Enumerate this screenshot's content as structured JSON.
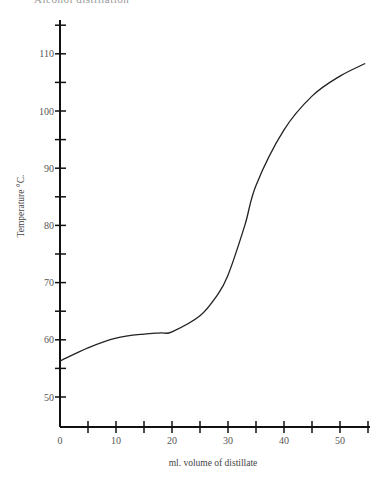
{
  "header": {
    "clipped_title": "Alcohol distillation"
  },
  "chart_data": {
    "type": "line",
    "title": "",
    "xlabel": "ml. volume of distillate",
    "ylabel": "Temperature °C.",
    "xlim": [
      0,
      55
    ],
    "ylim": [
      45,
      115
    ],
    "grid": false,
    "legend": null,
    "x_ticks_labeled": [
      0,
      10,
      20,
      30,
      40,
      50
    ],
    "x_ticks_minor": [
      5,
      15,
      25,
      35,
      45,
      55
    ],
    "y_ticks_labeled": [
      50,
      60,
      70,
      80,
      90,
      100,
      110
    ],
    "y_ticks_minor": [
      55,
      65,
      75,
      85,
      95,
      105,
      115
    ],
    "series": [
      {
        "name": "Distillation curve",
        "x": [
          0,
          5,
          10,
          15,
          18,
          20,
          25,
          28,
          30,
          33,
          35,
          40,
          45,
          50,
          54.5
        ],
        "y": [
          56.3,
          58.6,
          60.3,
          61.0,
          61.2,
          61.4,
          64.2,
          67.7,
          71.3,
          80.0,
          87.0,
          96.7,
          102.6,
          106.1,
          108.3
        ]
      }
    ]
  }
}
